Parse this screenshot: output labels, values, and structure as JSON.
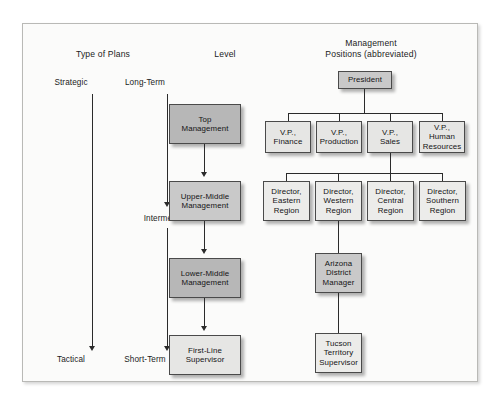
{
  "diagram": {
    "columns": {
      "plans": {
        "header": "Type of Plans"
      },
      "level": {
        "header": "Level"
      },
      "positions": {
        "header": "Management\nPositions (abbreviated)"
      }
    },
    "plan_scale": {
      "strategic_top": "Strategic",
      "strategic_bottom": "Tactical",
      "time_top": "Long-Term",
      "time_middle": "Intermediate",
      "time_bottom": "Short-Term"
    },
    "levels": [
      {
        "id": "top-management",
        "label": "Top\nManagement",
        "shade": "dark"
      },
      {
        "id": "upper-middle-management",
        "label": "Upper-Middle\nManagement",
        "shade": "mid"
      },
      {
        "id": "lower-middle-management",
        "label": "Lower-Middle\nManagement",
        "shade": "dark"
      },
      {
        "id": "first-line-supervisor",
        "label": "First-Line\nSupervisor",
        "shade": "light"
      }
    ],
    "org": {
      "president": {
        "label": "President",
        "shade": "mid"
      },
      "vice_presidents": [
        {
          "id": "vp-finance",
          "label": "V.P.,\nFinance",
          "shade": "light"
        },
        {
          "id": "vp-production",
          "label": "V.P.,\nProduction",
          "shade": "light"
        },
        {
          "id": "vp-sales",
          "label": "V.P.,\nSales",
          "shade": "light"
        },
        {
          "id": "vp-human-resources",
          "label": "V.P.,\nHuman\nResources",
          "shade": "light"
        }
      ],
      "directors": [
        {
          "id": "director-eastern",
          "label": "Director,\nEastern\nRegion",
          "shade": "pale"
        },
        {
          "id": "director-western",
          "label": "Director,\nWestern\nRegion",
          "shade": "pale"
        },
        {
          "id": "director-central",
          "label": "Director,\nCentral\nRegion",
          "shade": "pale"
        },
        {
          "id": "director-southern",
          "label": "Director,\nSouthern\nRegion",
          "shade": "pale"
        }
      ],
      "district_manager": {
        "label": "Arizona\nDistrict\nManager",
        "shade": "mid"
      },
      "territory_supervisor": {
        "label": "Tucson\nTerritory\nSupervisor",
        "shade": "pale"
      }
    },
    "colors": {
      "frame_border": "#b9b9b6",
      "plate_bg": "#fbfbfa",
      "box_border": "#4a4a4a",
      "connector": "#2b2b2b",
      "shade_dark": "#b7b7b7",
      "shade_mid": "#c9c9c9",
      "shade_light": "#e6e6e4",
      "shade_pale": "#ececea"
    }
  }
}
